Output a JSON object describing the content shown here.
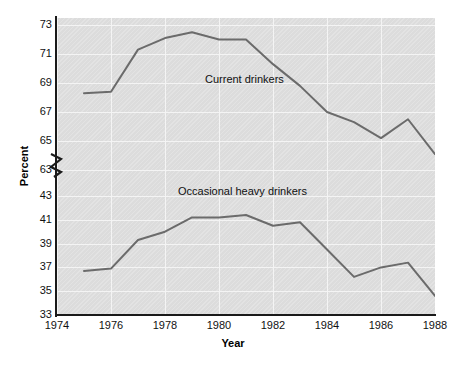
{
  "chart_data": {
    "type": "line",
    "title": "",
    "xlabel": "Year",
    "ylabel": "Percent",
    "grid": true,
    "legend_position": "inline-annotation",
    "axis_break": {
      "present": true,
      "between": [
        63,
        43
      ],
      "symbol": "zigzag"
    },
    "x": [
      1975,
      1976,
      1977,
      1978,
      1979,
      1980,
      1981,
      1982,
      1983,
      1984,
      1985,
      1986,
      1987,
      1988
    ],
    "xlim": [
      1974,
      1988
    ],
    "xticks": [
      "1974",
      "1976",
      "1978",
      "1980",
      "1982",
      "1984",
      "1986",
      "1988"
    ],
    "xtick_values": [
      1974,
      1976,
      1978,
      1980,
      1982,
      1984,
      1986,
      1988
    ],
    "yticks_upper": [
      "73",
      "71",
      "69",
      "67",
      "65",
      "63"
    ],
    "ytick_values_upper": [
      73,
      71,
      69,
      67,
      65,
      63
    ],
    "yticks_lower": [
      "43",
      "41",
      "39",
      "37",
      "35",
      "33"
    ],
    "ytick_values_lower": [
      43,
      41,
      39,
      37,
      35,
      33
    ],
    "ylim_upper": [
      63,
      73
    ],
    "ylim_lower": [
      33,
      43
    ],
    "series": [
      {
        "name": "Current drinkers",
        "panel": "upper",
        "values": [
          68.3,
          68.4,
          71.3,
          72.1,
          72.5,
          72.0,
          72.0,
          70.3,
          68.8,
          67.0,
          66.3,
          65.2,
          66.5,
          64.1
        ]
      },
      {
        "name": "Occasional heavy drinkers",
        "panel": "lower",
        "values": [
          36.7,
          36.9,
          39.3,
          40.0,
          41.2,
          41.2,
          41.4,
          40.5,
          40.8,
          38.5,
          36.2,
          37.0,
          37.4,
          34.6
        ]
      }
    ],
    "colors": {
      "line": "#6b6b6b",
      "plot_background": "#dcdcdc",
      "gridline": "#f4f4f4",
      "axis": "#1a1a1a",
      "text": "#111111"
    }
  },
  "annotations": {
    "current_drinkers_label": "Current drinkers",
    "occasional_heavy_drinkers_label": "Occasional heavy drinkers"
  },
  "axes": {
    "x_title": "Year",
    "y_title": "Percent"
  }
}
